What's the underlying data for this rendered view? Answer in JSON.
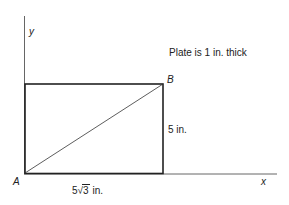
{
  "diagram": {
    "axes": {
      "x_label": "x",
      "y_label": "y"
    },
    "points": {
      "A": "A",
      "B": "B"
    },
    "note": "Plate is 1 in. thick",
    "dimensions": {
      "height_label": "5 in.",
      "width_prefix": "5",
      "width_radicand": "3",
      "width_unit": " in."
    },
    "colors": {
      "line": "#222222",
      "axis": "#555555",
      "background": "#ffffff"
    }
  }
}
